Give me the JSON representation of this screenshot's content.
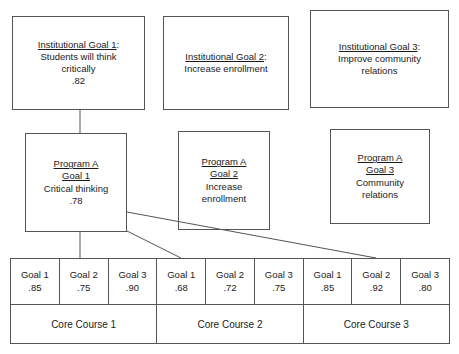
{
  "diagram": {
    "institutional_goals": [
      {
        "heading": "Institutional Goal 1",
        "heading_suffix": ":",
        "description_line1": "Students will think",
        "description_line2": "critically",
        "score": ".82"
      },
      {
        "heading": "Institutional Goal 2",
        "heading_suffix": ":",
        "description_line1": "Increase enrollment",
        "description_line2": "",
        "score": ""
      },
      {
        "heading": "Institutional Goal 3",
        "heading_suffix": ":",
        "description_line1": "Improve community",
        "description_line2": "relations",
        "score": ""
      }
    ],
    "program_goals": [
      {
        "program": "Program A",
        "goal": "Goal 1",
        "description_line1": "Critical thinking",
        "description_line2": "",
        "score": ".78"
      },
      {
        "program": "Program A",
        "goal": "Goal 2",
        "description_line1": "Increase",
        "description_line2": "enrollment",
        "score": ""
      },
      {
        "program": "Program A",
        "goal": "Goal 3",
        "description_line1": "Community",
        "description_line2": "relations",
        "score": ""
      }
    ],
    "goal_cells": [
      {
        "label": "Goal 1",
        "value": ".85"
      },
      {
        "label": "Goal 2",
        "value": ".75"
      },
      {
        "label": "Goal 3",
        "value": ".90"
      },
      {
        "label": "Goal 1",
        "value": ".68"
      },
      {
        "label": "Goal 2",
        "value": ".72"
      },
      {
        "label": "Goal 3",
        "value": ".75"
      },
      {
        "label": "Goal 1",
        "value": ".85"
      },
      {
        "label": "Goal 2",
        "value": ".92"
      },
      {
        "label": "Goal 3",
        "value": ".80"
      }
    ],
    "courses": [
      {
        "label": "Core Course 1",
        "span": 3
      },
      {
        "label": "Core Course 2",
        "span": 3
      },
      {
        "label": "Core Course 3",
        "span": 3
      }
    ],
    "colors": {
      "stroke": "#555555",
      "text": "#1a1a1a",
      "background": "#ffffff"
    }
  }
}
